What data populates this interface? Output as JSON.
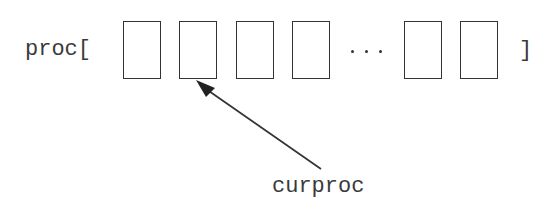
{
  "diagram": {
    "array_label": "proc[",
    "closing_bracket": "]",
    "ellipsis": "...",
    "pointer_label": "curproc",
    "pointer_target_index": 1,
    "cells": [
      {
        "index": 0,
        "x": 123
      },
      {
        "index": 1,
        "x": 179
      },
      {
        "index": 2,
        "x": 236
      },
      {
        "index": 3,
        "x": 292
      },
      {
        "index": 4,
        "x": 404
      },
      {
        "index": 5,
        "x": 460
      }
    ],
    "colors": {
      "stroke": "#333333",
      "text": "#3a3a3a",
      "background": "#ffffff"
    }
  }
}
